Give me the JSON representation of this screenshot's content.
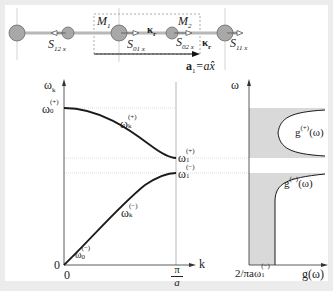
{
  "chain": {
    "masses": [
      {
        "name": "left-outer-mass",
        "x": 20,
        "y": 33,
        "r": 8
      },
      {
        "name": "left-small-mass",
        "x": 68,
        "y": 33,
        "r": 6
      },
      {
        "name": "m1-mass",
        "x": 118,
        "y": 33,
        "r": 8
      },
      {
        "name": "m2-mass",
        "x": 172,
        "y": 33,
        "r": 6
      },
      {
        "name": "right-outer-mass",
        "x": 225,
        "y": 33,
        "r": 8
      }
    ],
    "labels": {
      "M1": "M",
      "M1_sub": "1",
      "M2": "M",
      "M2_sub": "2",
      "kappa1": "κ",
      "kappa1_sub": "r",
      "kappa2": "κ",
      "kappa2_sub": "r",
      "S12": "S",
      "S12_sub": "12 x",
      "S01": "S",
      "S01_sub": "01 x",
      "S02": "S",
      "S02_sub": "02 x",
      "S11": "S",
      "S11_sub": "11 x",
      "a1": "a",
      "a1_sub": "1",
      "a1_eq": "=a",
      "a1_xhat": "x̂"
    }
  },
  "dispersion": {
    "y_axis_label": "ω",
    "y_axis_sub": "k",
    "x_axis_label": "k",
    "origin_y": "0",
    "origin_x": "0",
    "pi_over_a_num": "π",
    "pi_over_a_den": "a",
    "omega0_plus": "ω",
    "omega0_plus_sub": "0",
    "omega0_plus_sup": "(+)",
    "omegak_plus": "ω",
    "omegak_plus_sub": "k",
    "omegak_plus_sup": "(+)",
    "omega1_plus": "ω",
    "omega1_plus_sub": "1",
    "omega1_plus_sup": "(+)",
    "omega1_minus": "ω",
    "omega1_minus_sub": "1",
    "omega1_minus_sup": "(−)",
    "omegak_minus": "ω",
    "omegak_minus_sub": "k",
    "omegak_minus_sup": "(−)",
    "omega0_minus": "ω",
    "omega0_minus_sub": "0",
    "omega0_minus_sup": "(−)"
  },
  "dos": {
    "y_axis_label": "ω",
    "x_axis_label": "g(ω)",
    "g_plus": "g",
    "g_plus_sup": "(+)",
    "g_plus_arg": "(ω)",
    "g_minus": "g",
    "g_minus_sup": "(−)",
    "g_minus_arg": "(ω)",
    "x_tick": "2/πaω",
    "x_tick_sub": "1",
    "x_tick_sup": "(−)"
  },
  "colors": {
    "frame": "#ececec",
    "mass_fill": "#a8a8a8",
    "mass_stroke": "#6a6a6a",
    "rod": "#b8b8b8",
    "shade": "#d9d9d9",
    "curve": "#1a1a1a",
    "guide": "#bdbdbd"
  }
}
